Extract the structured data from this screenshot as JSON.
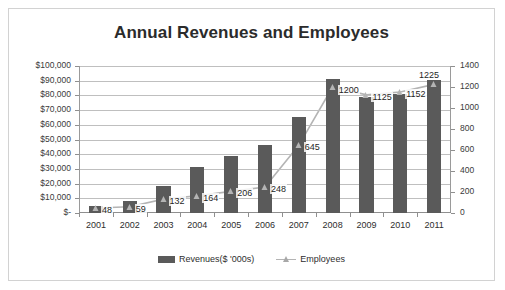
{
  "chart_data": {
    "type": "bar",
    "title": "Annual Revenues and Employees",
    "xlabel": "",
    "ylabel": "",
    "categories": [
      "2001",
      "2002",
      "2003",
      "2004",
      "2005",
      "2006",
      "2007",
      "2008",
      "2009",
      "2010",
      "2011"
    ],
    "series": [
      {
        "name": "Revenues($ '000s)",
        "type": "bar",
        "axis": "left",
        "color": "#5a5a5a",
        "values": [
          4500,
          8000,
          18500,
          31000,
          39000,
          46000,
          65500,
          91000,
          79000,
          81000,
          90500
        ]
      },
      {
        "name": "Employees",
        "type": "line",
        "axis": "right",
        "color": "#b4b4b4",
        "values": [
          48,
          59,
          132,
          164,
          206,
          248,
          645,
          1200,
          1125,
          1152,
          1225
        ],
        "labels": [
          "48",
          "59",
          "132",
          "164",
          "206",
          "248",
          "645",
          "1200",
          "1125",
          "1152",
          "1225"
        ]
      }
    ],
    "left_axis": {
      "min": 0,
      "max": 100000,
      "step": 10000,
      "ticks": [
        "$-",
        "$10,000",
        "$20,000",
        "$30,000",
        "$40,000",
        "$50,000",
        "$60,000",
        "$70,000",
        "$80,000",
        "$90,000",
        "$100,000"
      ]
    },
    "right_axis": {
      "min": 0,
      "max": 1400,
      "step": 200,
      "ticks": [
        "0",
        "200",
        "400",
        "600",
        "800",
        "1000",
        "1200",
        "1400"
      ]
    },
    "grid": true,
    "legend_position": "bottom",
    "legend": [
      {
        "label": "Revenues($ '000s)",
        "marker": "bar-swatch",
        "color": "#5a5a5a"
      },
      {
        "label": "Employees",
        "marker": "line-triangle-swatch",
        "color": "#b4b4b4"
      }
    ],
    "colors": {
      "bar": "#5a5a5a",
      "line": "#b4b4b4",
      "grid": "#bfbfbf",
      "axis": "#8f8f8f",
      "text": "#2e2e2e",
      "border": "#d2d2d2",
      "background": "#ffffff"
    }
  }
}
